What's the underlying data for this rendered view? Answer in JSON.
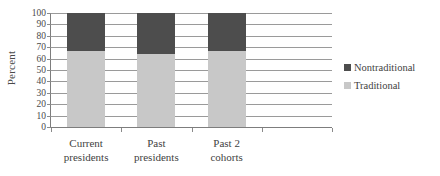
{
  "chart_data": {
    "type": "bar",
    "subtype": "stacked-100-percent",
    "title": "",
    "xlabel": "",
    "ylabel": "Percent",
    "ylim": [
      0,
      100
    ],
    "ytick_step": 10,
    "yticks": [
      100,
      90,
      80,
      70,
      60,
      50,
      40,
      30,
      20,
      10,
      0
    ],
    "grid": true,
    "grid_axis": "y",
    "legend_position": "right",
    "categories": [
      "Current presidents",
      "Past presidents",
      "Past 2 cohorts"
    ],
    "category_lines": [
      [
        "Current",
        "presidents"
      ],
      [
        "Past",
        "presidents"
      ],
      [
        "Past 2",
        "cohorts"
      ]
    ],
    "series": [
      {
        "name": "Traditional",
        "color": "#c8c8c8",
        "values": [
          67,
          64,
          67
        ]
      },
      {
        "name": "Nontraditional",
        "color": "#4d4d4d",
        "values": [
          33,
          36,
          33
        ]
      }
    ]
  },
  "legend": {
    "items": [
      {
        "label": "Nontraditional",
        "color": "#4d4d4d"
      },
      {
        "label": "Traditional",
        "color": "#c8c8c8"
      }
    ]
  },
  "axes": {
    "y_title": "Percent"
  }
}
